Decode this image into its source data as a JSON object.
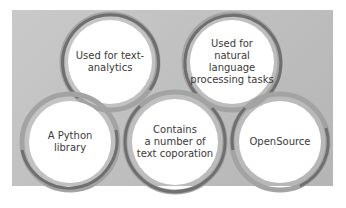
{
  "diagram": {
    "type": "interlocking-circles",
    "nodes": [
      {
        "id": "top-left",
        "label": "Used for text-\nanalytics"
      },
      {
        "id": "top-right",
        "label": "Used for\nnatural language\nprocessing tasks"
      },
      {
        "id": "bottom-left",
        "label": "A Python\nlibrary"
      },
      {
        "id": "bottom-center",
        "label": "Contains\na number of\ntext coporation"
      },
      {
        "id": "bottom-right",
        "label": "OpenSource"
      }
    ],
    "colors": {
      "panel": "#bfbfbf",
      "ring_outer": "#7d7d7d",
      "ring_inner": "#a3a3a3",
      "circle_fill": "#ffffff",
      "text": "#3a3a3a"
    }
  }
}
